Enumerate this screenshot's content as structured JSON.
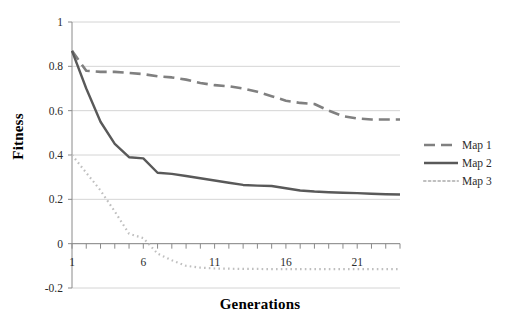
{
  "chart_data": {
    "type": "line",
    "title": "",
    "xlabel": "Generations",
    "ylabel": "Fitness",
    "xlim": [
      1,
      24
    ],
    "ylim": [
      -0.2,
      1
    ],
    "grid": true,
    "legend_position": "right",
    "y_ticks": [
      "1",
      "0.8",
      "0.6",
      "0.4",
      "0.2",
      "0",
      "-0.2"
    ],
    "y_tick_values": [
      1,
      0.8,
      0.6,
      0.4,
      0.2,
      0,
      -0.2
    ],
    "x_ticks": [
      "1",
      "6",
      "11",
      "16",
      "21"
    ],
    "x_tick_values": [
      1,
      6,
      11,
      16,
      21
    ],
    "x": [
      1,
      2,
      3,
      4,
      5,
      6,
      7,
      8,
      9,
      10,
      11,
      12,
      13,
      14,
      15,
      16,
      17,
      18,
      19,
      20,
      21,
      22,
      23,
      24
    ],
    "series": [
      {
        "name": "Map 1",
        "style": "dashed",
        "color": "#808080",
        "values": [
          0.87,
          0.78,
          0.775,
          0.775,
          0.77,
          0.765,
          0.755,
          0.75,
          0.74,
          0.725,
          0.715,
          0.71,
          0.7,
          0.685,
          0.665,
          0.645,
          0.635,
          0.63,
          0.6,
          0.575,
          0.565,
          0.56,
          0.56,
          0.56
        ]
      },
      {
        "name": "Map 2",
        "style": "solid",
        "color": "#595959",
        "values": [
          0.87,
          0.7,
          0.55,
          0.45,
          0.39,
          0.385,
          0.32,
          0.315,
          0.305,
          0.295,
          0.285,
          0.275,
          0.265,
          0.262,
          0.26,
          0.25,
          0.24,
          0.235,
          0.232,
          0.23,
          0.228,
          0.225,
          0.223,
          0.222
        ]
      },
      {
        "name": "Map 3",
        "style": "dotted",
        "color": "#bfbfbf",
        "values": [
          0.4,
          0.32,
          0.24,
          0.145,
          0.045,
          0.025,
          -0.045,
          -0.075,
          -0.1,
          -0.108,
          -0.112,
          -0.113,
          -0.114,
          -0.114,
          -0.115,
          -0.115,
          -0.115,
          -0.115,
          -0.115,
          -0.115,
          -0.115,
          -0.115,
          -0.115,
          -0.115
        ]
      }
    ]
  },
  "legend": {
    "items": [
      {
        "label": "Map 1"
      },
      {
        "label": "Map 2"
      },
      {
        "label": "Map 3"
      }
    ]
  }
}
